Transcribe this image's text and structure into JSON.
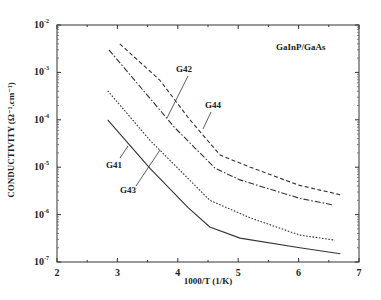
{
  "chart_data": {
    "type": "line",
    "title": "",
    "annotation": "GaInP/GaAs",
    "xlabel": "1000/T (1/K)",
    "ylabel": "CONDUCTIVITY (Ω⁻¹.cm⁻¹)",
    "xlim": [
      2,
      7
    ],
    "ylim": [
      1e-07,
      0.01
    ],
    "yscale": "log",
    "x_ticks": [
      "2",
      "3",
      "4",
      "5",
      "6",
      "7"
    ],
    "y_ticks": [
      "10⁻²",
      "10⁻³",
      "10⁻⁴",
      "10⁻⁵",
      "10⁻⁶",
      "10⁻⁷"
    ],
    "grid": false,
    "legend": "inline labels",
    "series": [
      {
        "name": "G44",
        "style": "dashed",
        "x": [
          3.04,
          3.7,
          4.2,
          4.7,
          5.2,
          6.0,
          6.7
        ],
        "y": [
          0.004,
          0.00069,
          0.0001,
          1.8e-05,
          1e-05,
          4.2e-06,
          2.6e-06
        ]
      },
      {
        "name": "G42",
        "style": "dash-dot",
        "x": [
          2.86,
          3.95,
          4.62,
          5.03,
          6.02,
          6.57
        ],
        "y": [
          0.003,
          6.8e-05,
          9.5e-06,
          5.4e-06,
          2.2e-06,
          1.6e-06
        ]
      },
      {
        "name": "G43",
        "style": "dotted",
        "x": [
          2.84,
          3.54,
          4.53,
          5.2,
          6.02,
          6.6
        ],
        "y": [
          0.00041,
          3.7e-05,
          2e-06,
          8.5e-07,
          3.7e-07,
          2.9e-07
        ]
      },
      {
        "name": "G41",
        "style": "solid",
        "x": [
          2.84,
          3.54,
          4.17,
          4.53,
          5.03,
          6.02,
          6.69
        ],
        "y": [
          0.0001,
          9.5e-06,
          1.4e-06,
          5.5e-07,
          3.2e-07,
          2e-07,
          1.5e-07
        ]
      }
    ]
  },
  "labels": {
    "annotation": "GaInP/GaAs",
    "xlabel": "1000/T (1/K)",
    "ylabel": "CONDUCTIVITY  (Ω⁻¹.cm⁻¹)",
    "x_ticks": [
      "2",
      "3",
      "4",
      "5",
      "6",
      "7"
    ],
    "y_ticks": [
      "-2",
      "-3",
      "-4",
      "-5",
      "-6",
      "-7"
    ],
    "series": [
      "G44",
      "G42",
      "G43",
      "G41"
    ]
  }
}
